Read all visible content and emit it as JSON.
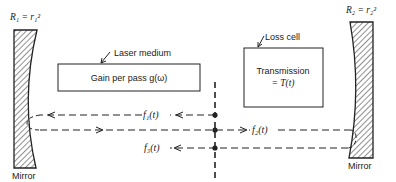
{
  "diagram": {
    "left_mirror": {
      "reflectance_label": "R₁ = r₁²",
      "caption": "Mirror"
    },
    "right_mirror": {
      "reflectance_label": "R₂ = r₂²",
      "caption": "Mirror"
    },
    "laser_medium": {
      "callout": "Laser medium",
      "text": "Gain per pass g(ω)"
    },
    "loss_cell": {
      "callout": "Loss cell",
      "line1": "Transmission",
      "line2": "= T(t)"
    },
    "signals": {
      "f1": "f₁(t)",
      "f2": "f₂(t)",
      "f3": "f₃(t)"
    },
    "colors": {
      "ink": "#222222",
      "background": "#ffffff"
    }
  }
}
